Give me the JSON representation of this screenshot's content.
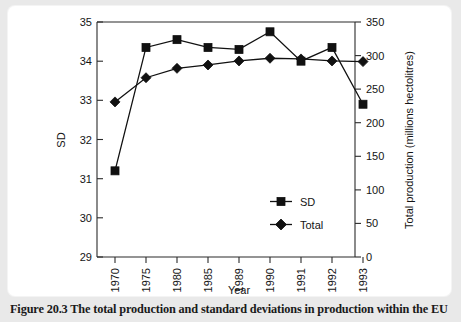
{
  "figure": {
    "caption": "Figure 20.3  The total production and standard deviations in production within the EU",
    "background_color": "#e9e9e9",
    "panel_color": "#ffffff",
    "ink_color": "#111111"
  },
  "chart_data": {
    "type": "line",
    "title": "",
    "subtitle": "",
    "xlabel": "Year",
    "ylabel": "SD",
    "y2label": "Total production (millions hectolitres)",
    "categories": [
      "1970",
      "1975",
      "1980",
      "1985",
      "1989",
      "1990",
      "1991",
      "1992",
      "1993"
    ],
    "ylim": [
      29,
      35
    ],
    "yticks": [
      29,
      30,
      31,
      32,
      33,
      34,
      35
    ],
    "ytick_labels": [
      "29",
      "30",
      "31",
      "32",
      "33",
      "34",
      "35"
    ],
    "y2lim": [
      0,
      350
    ],
    "y2ticks": [
      0,
      50,
      100,
      150,
      200,
      250,
      300,
      350
    ],
    "y2tick_labels": [
      "0",
      "50",
      "100",
      "150",
      "200",
      "250",
      "300",
      "350"
    ],
    "grid": false,
    "legend_position": "inside-lower-right",
    "series": [
      {
        "name": "SD",
        "axis": "left",
        "marker": "square",
        "values": [
          31.2,
          34.35,
          34.55,
          34.35,
          34.3,
          34.75,
          34.0,
          34.35,
          32.9
        ]
      },
      {
        "name": "Total",
        "axis": "right",
        "marker": "diamond",
        "values": [
          231,
          267,
          281,
          286,
          292,
          296,
          295,
          292,
          291
        ]
      }
    ],
    "legend": [
      {
        "label": "SD",
        "marker": "square"
      },
      {
        "label": "Total",
        "marker": "diamond"
      }
    ]
  }
}
